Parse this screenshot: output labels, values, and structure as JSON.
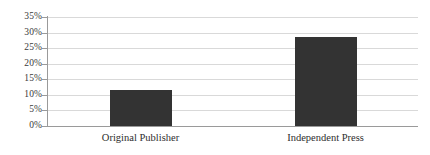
{
  "chart_data": {
    "type": "bar",
    "title": "",
    "xlabel": "",
    "ylabel": "",
    "categories": [
      "Original Publisher",
      "Independent Press"
    ],
    "values": [
      11.5,
      28.5
    ],
    "value_labels": [
      "11.5%",
      "28.5%"
    ],
    "ylim": [
      0,
      35
    ],
    "ytick_labels": [
      "0%",
      "5%",
      "10%",
      "15%",
      "20%",
      "25%",
      "30%",
      "35%"
    ],
    "ytick_values": [
      0,
      5,
      10,
      15,
      20,
      25,
      30,
      35
    ],
    "grid": true,
    "legend": "none",
    "bar_color": "#333333",
    "gridline_color": "#d9d9d9",
    "axis_color": "#9a9a9a"
  }
}
